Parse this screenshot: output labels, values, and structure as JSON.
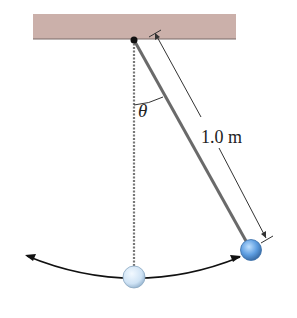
{
  "diagram": {
    "type": "pendulum",
    "angle_label": "θ",
    "length_label": "1.0 m",
    "colors": {
      "ceiling": "#cbb0aa",
      "ceiling_edge": "#7a6a68",
      "string": "#6f6f6f",
      "bob_fill": "#5d9de0",
      "bob_rest_fill": "#cfe3f5",
      "arrow": "#111111"
    }
  }
}
